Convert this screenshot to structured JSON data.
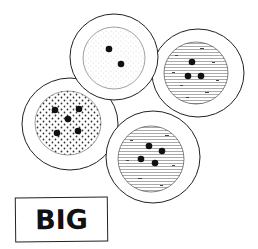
{
  "illustration": {
    "subject": "four round cookies with holes",
    "label": "BIG",
    "colors": {
      "ink": "#1a1a1a",
      "background": "#ffffff"
    },
    "items": [
      {
        "name": "top",
        "texture": "fine-dots",
        "holes": 2
      },
      {
        "name": "right",
        "texture": "hatched",
        "holes": 3
      },
      {
        "name": "left",
        "texture": "coarse-dots",
        "holes": 5
      },
      {
        "name": "bottom",
        "texture": "hatched",
        "holes": 4
      }
    ]
  }
}
